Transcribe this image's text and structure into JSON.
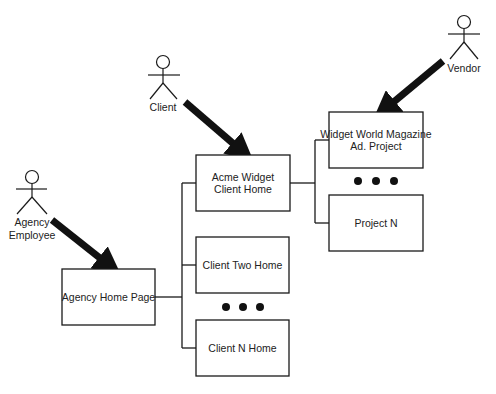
{
  "diagram": {
    "actors": [
      {
        "id": "agency-employee",
        "label_lines": [
          "Agency",
          "Employee"
        ]
      },
      {
        "id": "client",
        "label_lines": [
          "Client"
        ]
      },
      {
        "id": "vendor",
        "label_lines": [
          "Vendor"
        ]
      }
    ],
    "nodes": [
      {
        "id": "agency-home",
        "label_lines": [
          "Agency Home Page"
        ]
      },
      {
        "id": "acme-widget",
        "label_lines": [
          "Acme Widget",
          "Client Home"
        ]
      },
      {
        "id": "client-two",
        "label_lines": [
          "Client Two Home"
        ]
      },
      {
        "id": "client-n",
        "label_lines": [
          "Client N Home"
        ]
      },
      {
        "id": "widget-world",
        "label_lines": [
          "Widget World Magazine",
          "Ad. Project"
        ]
      },
      {
        "id": "project-n",
        "label_lines": [
          "Project N"
        ]
      }
    ],
    "ellipses": [
      {
        "id": "clients-ellipsis",
        "glyph": "● ● ●"
      },
      {
        "id": "projects-ellipsis",
        "glyph": "● ● ●"
      }
    ],
    "edges": [
      {
        "from": "agency-employee",
        "to": "agency-home",
        "type": "access-arrow"
      },
      {
        "from": "client",
        "to": "acme-widget",
        "type": "access-arrow"
      },
      {
        "from": "vendor",
        "to": "widget-world",
        "type": "access-arrow"
      },
      {
        "from": "agency-home",
        "to": "acme-widget",
        "type": "tree"
      },
      {
        "from": "agency-home",
        "to": "client-two",
        "type": "tree"
      },
      {
        "from": "agency-home",
        "to": "client-n",
        "type": "tree"
      },
      {
        "from": "acme-widget",
        "to": "widget-world",
        "type": "tree"
      },
      {
        "from": "acme-widget",
        "to": "project-n",
        "type": "tree"
      }
    ],
    "colors": {
      "line": "#1a1a1a",
      "box_fill": "#ffffff",
      "text": "#222222"
    }
  }
}
